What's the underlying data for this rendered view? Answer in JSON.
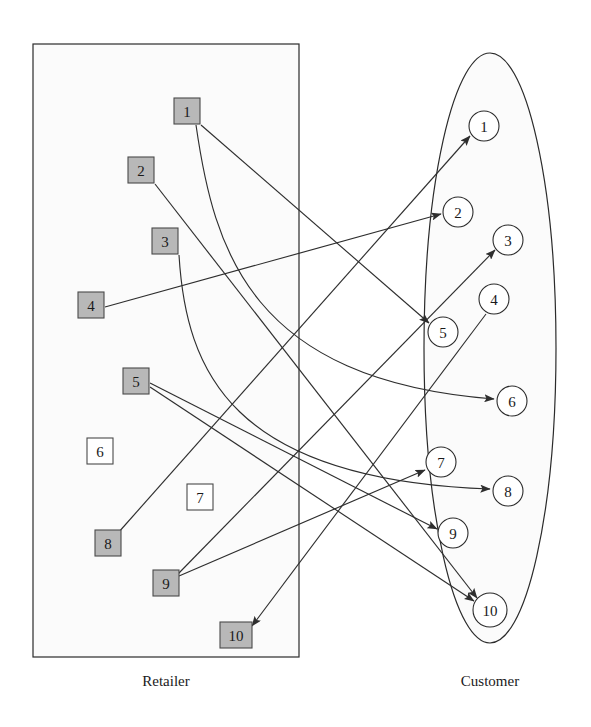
{
  "figure": {
    "type": "bipartite-network-diagram",
    "title": "",
    "background_color": "#ffffff",
    "ink_color": "#2e2e2e"
  },
  "groups": {
    "left": {
      "caption": "Retailer",
      "shape": "rectangle",
      "caption_x": 166,
      "caption_y": 686,
      "rect": {
        "x": 33,
        "y": 44,
        "width": 266,
        "height": 613
      }
    },
    "right": {
      "caption": "Customer",
      "shape": "ellipse",
      "caption_x": 490,
      "caption_y": 686,
      "ellipse": {
        "cx": 490,
        "cy": 348,
        "rx": 66,
        "ry": 295
      }
    }
  },
  "style": {
    "filled_node_color": "#b8b8b8",
    "empty_node_color": "#ffffff",
    "node_stroke": "#4a4a4a",
    "edge_stroke": "#2e2e2e"
  },
  "retailers": [
    {
      "id": 1,
      "label": "1",
      "x": 187,
      "y": 111,
      "state": "filled"
    },
    {
      "id": 2,
      "label": "2",
      "x": 141,
      "y": 170,
      "state": "filled"
    },
    {
      "id": 3,
      "label": "3",
      "x": 165,
      "y": 241,
      "state": "filled"
    },
    {
      "id": 4,
      "label": "4",
      "x": 91,
      "y": 305,
      "state": "filled"
    },
    {
      "id": 5,
      "label": "5",
      "x": 136,
      "y": 381,
      "state": "filled"
    },
    {
      "id": 6,
      "label": "6",
      "x": 100,
      "y": 451,
      "state": "empty"
    },
    {
      "id": 7,
      "label": "7",
      "x": 200,
      "y": 497,
      "state": "empty"
    },
    {
      "id": 8,
      "label": "8",
      "x": 108,
      "y": 543,
      "state": "filled"
    },
    {
      "id": 9,
      "label": "9",
      "x": 166,
      "y": 583,
      "state": "filled"
    },
    {
      "id": 10,
      "label": "10",
      "x": 236,
      "y": 635,
      "state": "filled"
    }
  ],
  "customers": [
    {
      "id": 1,
      "label": "1",
      "x": 484,
      "y": 126
    },
    {
      "id": 2,
      "label": "2",
      "x": 458,
      "y": 212
    },
    {
      "id": 3,
      "label": "3",
      "x": 508,
      "y": 240
    },
    {
      "id": 4,
      "label": "4",
      "x": 494,
      "y": 299
    },
    {
      "id": 5,
      "label": "5",
      "x": 443,
      "y": 332
    },
    {
      "id": 6,
      "label": "6",
      "x": 512,
      "y": 401
    },
    {
      "id": 7,
      "label": "7",
      "x": 441,
      "y": 462
    },
    {
      "id": 8,
      "label": "8",
      "x": 508,
      "y": 491
    },
    {
      "id": 9,
      "label": "9",
      "x": 453,
      "y": 533
    },
    {
      "id": 10,
      "label": "10",
      "x": 490,
      "y": 610
    }
  ],
  "node_geometry": {
    "retailer_box_size": 26,
    "retailer_box_wide": 32,
    "customer_radius": 15,
    "customer_radius_wide": 17
  },
  "edges": [
    {
      "id": "e1",
      "from": "retailer-1",
      "to": "customer-5",
      "kind": "line",
      "arrow_at": "to"
    },
    {
      "id": "e2",
      "from": "retailer-1",
      "to": "customer-6",
      "kind": "curve",
      "arrow_at": "to"
    },
    {
      "id": "e3",
      "from": "retailer-2",
      "to": "customer-10",
      "kind": "line",
      "arrow_at": "to"
    },
    {
      "id": "e4",
      "from": "retailer-3",
      "to": "customer-8",
      "kind": "curve",
      "arrow_at": "to"
    },
    {
      "id": "e5",
      "from": "retailer-4",
      "to": "customer-2",
      "kind": "line",
      "arrow_at": "to"
    },
    {
      "id": "e6",
      "from": "retailer-5",
      "to": "customer-9",
      "kind": "line",
      "arrow_at": "to"
    },
    {
      "id": "e7",
      "from": "retailer-5",
      "to": "customer-10",
      "kind": "line",
      "arrow_at": "to"
    },
    {
      "id": "e8",
      "from": "retailer-8",
      "to": "customer-1",
      "kind": "line",
      "arrow_at": "to"
    },
    {
      "id": "e9",
      "from": "retailer-9",
      "to": "customer-3",
      "kind": "line",
      "arrow_at": "to"
    },
    {
      "id": "e10",
      "from": "retailer-9",
      "to": "customer-7",
      "kind": "line",
      "arrow_at": "to"
    },
    {
      "id": "e11",
      "from": "customer-4",
      "to": "retailer-10",
      "kind": "line",
      "arrow_at": "to"
    }
  ],
  "edge_paths": [
    {
      "id": "e1",
      "d": "M 201,125 L 429,323"
    },
    {
      "id": "e2",
      "d": "M 196,125 C 214,250 250,380 494,399"
    },
    {
      "id": "e3",
      "d": "M 155,184 L 477,598"
    },
    {
      "id": "e4",
      "d": "M 179,255 C 186,370 230,480 490,489"
    },
    {
      "id": "e5",
      "d": "M 105,307 L 441,214"
    },
    {
      "id": "e6",
      "d": "M 150,383 L 437,529"
    },
    {
      "id": "e7",
      "d": "M 150,387 L 474,601"
    },
    {
      "id": "e8",
      "d": "M 118,533 L 470,136"
    },
    {
      "id": "e9",
      "d": "M 178,574 L 495,250"
    },
    {
      "id": "e10",
      "d": "M 179,576 L 425,470"
    },
    {
      "id": "e11",
      "d": "M 486,314 L 252,626"
    }
  ]
}
